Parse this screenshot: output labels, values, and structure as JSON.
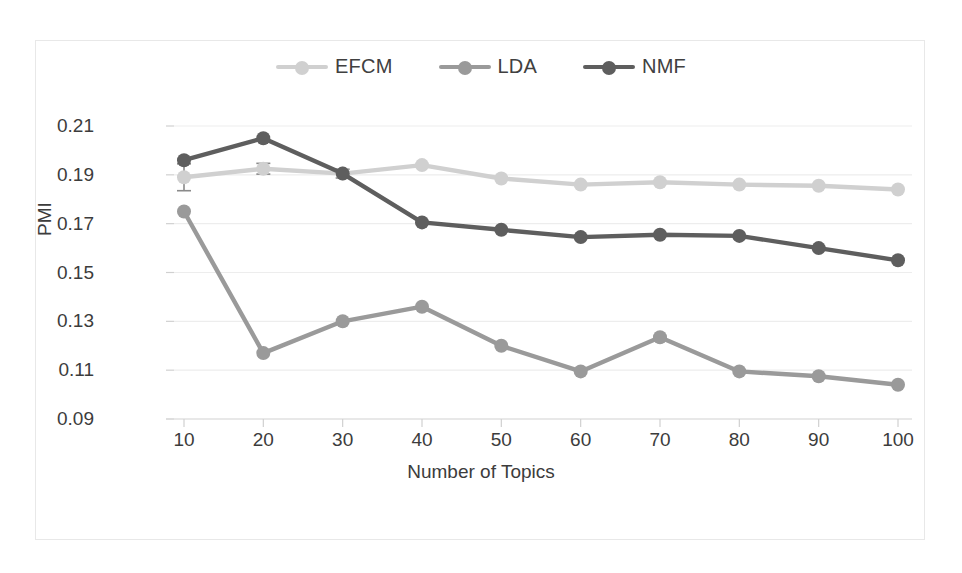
{
  "chart_data": {
    "type": "line",
    "title": "",
    "xlabel": "Number of Topics",
    "ylabel": "PMI",
    "x": [
      10,
      20,
      30,
      40,
      50,
      60,
      70,
      80,
      90,
      100
    ],
    "categories": [
      "10",
      "20",
      "30",
      "40",
      "50",
      "60",
      "70",
      "80",
      "90",
      "100"
    ],
    "xlim": [
      10,
      100
    ],
    "ylim": [
      0.09,
      0.21
    ],
    "yticks": [
      0.09,
      0.11,
      0.13,
      0.15,
      0.17,
      0.19,
      0.21
    ],
    "ytick_labels": [
      "0.09",
      "0.11",
      "0.13",
      "0.15",
      "0.17",
      "0.19",
      "0.21"
    ],
    "grid": true,
    "legend_position": "top-center",
    "series": [
      {
        "name": "EFCM",
        "color": "#d0d0d0",
        "marker": "circle",
        "values": [
          0.189,
          0.1925,
          0.1905,
          0.194,
          0.1885,
          0.186,
          0.187,
          0.186,
          0.1855,
          0.184
        ],
        "error_bars": [
          0.0055,
          0.0022,
          0.0018,
          0,
          0,
          0,
          0,
          0,
          0,
          0
        ]
      },
      {
        "name": "LDA",
        "color": "#9a9a9a",
        "marker": "circle",
        "values": [
          0.175,
          0.117,
          0.13,
          0.136,
          0.12,
          0.1095,
          0.1235,
          0.1095,
          0.1075,
          0.104
        ],
        "error_bars": [
          0,
          0,
          0,
          0,
          0,
          0,
          0,
          0,
          0,
          0
        ]
      },
      {
        "name": "NMF",
        "color": "#5e5e5e",
        "marker": "circle",
        "values": [
          0.196,
          0.205,
          0.1905,
          0.1705,
          0.1675,
          0.1645,
          0.1655,
          0.165,
          0.16,
          0.155
        ],
        "error_bars": [
          0,
          0,
          0,
          0,
          0,
          0,
          0,
          0,
          0,
          0
        ]
      }
    ]
  },
  "legend": {
    "items": [
      {
        "label": "EFCM",
        "color": "#d0d0d0"
      },
      {
        "label": "LDA",
        "color": "#9a9a9a"
      },
      {
        "label": "NMF",
        "color": "#5e5e5e"
      }
    ]
  },
  "axes": {
    "y_title": "PMI",
    "x_title": "Number of Topics"
  }
}
